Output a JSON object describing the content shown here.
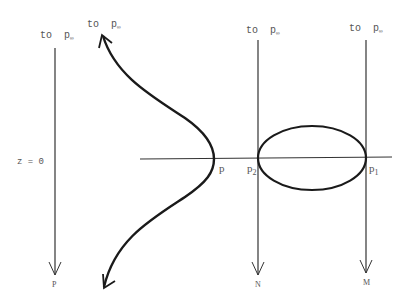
{
  "diagram": {
    "top_labels": [
      {
        "id": "left",
        "to": "to",
        "p": "p",
        "sub": "∞"
      },
      {
        "id": "curve",
        "to": "to",
        "p": "p",
        "sub": "∞"
      },
      {
        "id": "n",
        "to": "to",
        "p": "p",
        "sub": "∞"
      },
      {
        "id": "m",
        "to": "to",
        "p": "p",
        "sub": "∞"
      }
    ],
    "axis_label": "z = 0",
    "points": {
      "p": "p",
      "p2_base": "p",
      "p2_sub": "2",
      "p1_base": "p",
      "p1_sub": "1"
    },
    "bottom_labels": {
      "left": "P",
      "n": "N",
      "m": "M"
    },
    "stroke_color": "#1a1a1a",
    "thin_stroke_color": "#333333"
  }
}
